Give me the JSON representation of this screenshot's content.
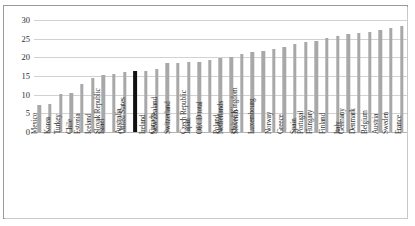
{
  "chart_data": {
    "type": "bar",
    "title": "",
    "subtitle": "",
    "xlabel": "",
    "ylabel": "",
    "ylim": [
      0,
      30
    ],
    "ytick_labels": [
      "0",
      "5",
      "10",
      "15",
      "20",
      "25",
      "30"
    ],
    "ytick_values": [
      0,
      5,
      10,
      15,
      20,
      25,
      30
    ],
    "grid": true,
    "legend": false,
    "highlight_category": "United States",
    "highlight_color": "#111111",
    "bar_color": "#a8a8a8",
    "categories": [
      "Mexico",
      "Korea",
      "Turkey",
      "Chile",
      "Estonia",
      "Iceland",
      "Israel",
      "Slovak Republic",
      "Australia",
      "United States",
      "Ireland",
      "Canada",
      "New Zealand",
      "Switzerland",
      "Japan",
      "Czech Republic",
      "OECD total",
      "Poland",
      "Netherlands",
      "Slovenia",
      "United Kingdom",
      "Luxembourg",
      "Norway",
      "Greece",
      "Spain",
      "Portugal",
      "Hungary",
      "Finland",
      "Italy",
      "Germany",
      "Denmark",
      "Belgium",
      "Austria",
      "Sweden",
      "France"
    ],
    "values": [
      7.2,
      7.6,
      10.2,
      10.4,
      12.9,
      14.5,
      15.4,
      15.6,
      16.0,
      16.3,
      16.4,
      17.0,
      18.4,
      18.6,
      18.7,
      18.8,
      19.2,
      19.7,
      20.2,
      20.8,
      21.4,
      21.8,
      22.2,
      22.8,
      23.5,
      24.1,
      24.5,
      25.2,
      25.6,
      26.2,
      26.6,
      26.9,
      27.4,
      27.9,
      28.5
    ]
  }
}
